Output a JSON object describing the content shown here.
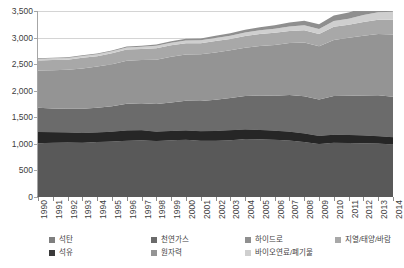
{
  "chart_data": {
    "type": "area",
    "stacked": true,
    "title": "",
    "xlabel": "",
    "ylabel": "",
    "ylim": [
      0,
      3500
    ],
    "ytick_step": 500,
    "ytick_labels": [
      "3,500",
      "3,000",
      "2,500",
      "2,000",
      "1,500",
      "1,000",
      "500",
      "0"
    ],
    "ytick_values": [
      3500,
      3000,
      2500,
      2000,
      1500,
      1000,
      500,
      0
    ],
    "grid": true,
    "grid_axis": "y",
    "legend_position": "bottom",
    "categories": [
      1990,
      1991,
      1992,
      1993,
      1994,
      1995,
      1996,
      1997,
      1998,
      1999,
      2000,
      2001,
      2002,
      2003,
      2004,
      2005,
      2006,
      2007,
      2008,
      2009,
      2010,
      2011,
      2012,
      2013,
      2014
    ],
    "xtick_labels": [
      "1990",
      "1991",
      "1992",
      "1993",
      "1994",
      "1995",
      "1996",
      "1997",
      "1998",
      "1999",
      "2000",
      "2001",
      "2002",
      "2003",
      "2004",
      "2005",
      "2006",
      "2007",
      "2008",
      "2009",
      "2010",
      "2011",
      "2012",
      "2013",
      "2014"
    ],
    "series": [
      {
        "name": "석유",
        "color": "#595959",
        "values": [
          1010,
          1020,
          1025,
          1020,
          1035,
          1045,
          1060,
          1070,
          1055,
          1070,
          1075,
          1060,
          1060,
          1070,
          1090,
          1085,
          1075,
          1065,
          1035,
          995,
          1020,
          1015,
          1010,
          1005,
          990
        ]
      },
      {
        "name": "석탄",
        "color": "#7f7f7f",
        "values": [
          215,
          200,
          190,
          185,
          180,
          185,
          190,
          185,
          175,
          170,
          175,
          175,
          180,
          185,
          180,
          175,
          170,
          165,
          160,
          155,
          150,
          150,
          145,
          140,
          135
        ]
      },
      {
        "name": "천연가스",
        "color": "#6b6b6b",
        "values": [
          455,
          445,
          445,
          455,
          465,
          480,
          505,
          510,
          520,
          540,
          560,
          570,
          590,
          610,
          630,
          650,
          660,
          690,
          700,
          685,
          730,
          740,
          755,
          770,
          760
        ]
      },
      {
        "name": "원자력",
        "color": "#949494",
        "values": [
          700,
          720,
          735,
          760,
          775,
          790,
          810,
          815,
          835,
          860,
          870,
          880,
          890,
          895,
          910,
          930,
          955,
          980,
          1010,
          1000,
          1055,
          1090,
          1125,
          1150,
          1175
        ]
      },
      {
        "name": "하이드로",
        "color": "#a8a8a8",
        "values": [
          190,
          195,
          190,
          200,
          195,
          205,
          210,
          205,
          215,
          215,
          215,
          210,
          215,
          215,
          220,
          225,
          230,
          225,
          235,
          230,
          250,
          245,
          260,
          270,
          275
        ]
      },
      {
        "name": "바이오연료/폐기물",
        "color": "#cfcfcf",
        "values": [
          28,
          29,
          30,
          32,
          34,
          36,
          38,
          41,
          44,
          47,
          50,
          53,
          57,
          61,
          66,
          71,
          77,
          84,
          92,
          95,
          105,
          115,
          128,
          140,
          152
        ]
      },
      {
        "name": "지열/태양/바람",
        "color": "#8f8f8f",
        "values": [
          12,
          13,
          14,
          15,
          16,
          18,
          20,
          22,
          25,
          28,
          32,
          35,
          40,
          45,
          52,
          58,
          66,
          75,
          85,
          92,
          105,
          118,
          132,
          148,
          165
        ]
      }
    ],
    "totals": [
      2610,
      2622,
      2629,
      2667,
      2700,
      2759,
      2833,
      2848,
      2869,
      2930,
      2977,
      2983,
      3032,
      3081,
      3148,
      3194,
      3233,
      3284,
      3317,
      3252,
      3415,
      3473,
      3555,
      3623,
      3652
    ]
  },
  "legend": {
    "items": [
      {
        "label": "석탄",
        "color": "#7f7f7f",
        "row": 0,
        "col": 0
      },
      {
        "label": "석유",
        "color": "#3a3a3a",
        "row": 1,
        "col": 0
      },
      {
        "label": "천연가스",
        "color": "#6b6b6b",
        "row": 0,
        "col": 1
      },
      {
        "label": "원자력",
        "color": "#949494",
        "row": 1,
        "col": 1
      },
      {
        "label": "하이드로",
        "color": "#8f8f8f",
        "row": 0,
        "col": 2
      },
      {
        "label": "바이오연료/폐기물",
        "color": "#cfcfcf",
        "row": 1,
        "col": 2
      },
      {
        "label": "지열/태양/바람",
        "color": "#a8a8a8",
        "row": 0,
        "col": 3
      }
    ]
  },
  "colors": {
    "background": "#ffffff",
    "grid": "#d4d4d4",
    "axis": "#a6a6a6",
    "text": "#3f3f3f",
    "band_coal": "#7f7f7f",
    "band_oil": "#262626",
    "band_gas": "#6b6b6b",
    "band_nuclear": "#949494",
    "band_hydro": "#8f8f8f",
    "band_bio": "#cfcfcf",
    "band_geo": "#a8a8a8"
  }
}
